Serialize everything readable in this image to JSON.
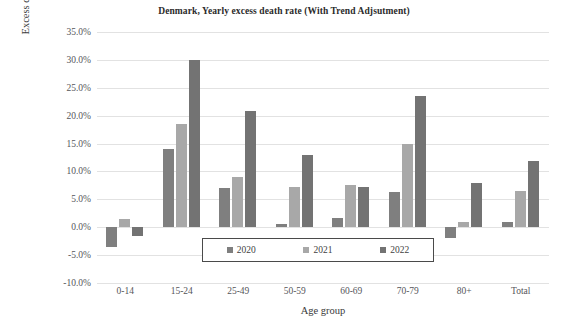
{
  "chart_data": {
    "type": "bar",
    "title": "Denmark, Yearly excess death rate (With Trend Adjsutment)",
    "xlabel": "Age group",
    "ylabel": "Excess death rate, %",
    "categories": [
      "0-14",
      "15-24",
      "25-49",
      "50-59",
      "60-69",
      "70-79",
      "80+",
      "Total"
    ],
    "series": [
      {
        "name": "2020",
        "color": "#7f7f7f",
        "values": [
          -3.5,
          14.0,
          7.0,
          0.5,
          1.6,
          6.3,
          -2.0,
          1.0
        ]
      },
      {
        "name": "2021",
        "color": "#a8a8a8",
        "values": [
          1.5,
          18.5,
          9.0,
          7.2,
          7.5,
          15.0,
          1.0,
          6.5
        ]
      },
      {
        "name": "2022",
        "color": "#737373",
        "values": [
          -1.5,
          30.0,
          20.8,
          13.0,
          7.3,
          23.5,
          8.0,
          11.8
        ]
      }
    ],
    "ylim": [
      -10.0,
      35.0
    ],
    "ystep": 5.0,
    "yticks": [
      "35.0%",
      "30.0%",
      "25.0%",
      "20.0%",
      "15.0%",
      "10.0%",
      "5.0%",
      "0.0%",
      "-5.0%",
      "-10.0%"
    ],
    "ytick_values": [
      35.0,
      30.0,
      25.0,
      20.0,
      15.0,
      10.0,
      5.0,
      0.0,
      -5.0,
      -10.0
    ],
    "grid": true,
    "legend_position": "inside-bottom-center"
  }
}
